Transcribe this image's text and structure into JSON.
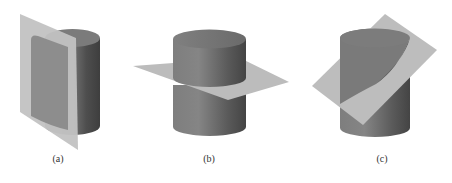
{
  "figure": {
    "panels": [
      {
        "id": "a",
        "label": "(a)",
        "plane_orientation": "vertical",
        "caption_x": 58
      },
      {
        "id": "b",
        "label": "(b)",
        "plane_orientation": "horizontal",
        "caption_x": 209
      },
      {
        "id": "c",
        "label": "(c)",
        "plane_orientation": "oblique",
        "caption_x": 382
      }
    ],
    "colors": {
      "cylinder_light": "#8a8a8a",
      "cylinder_dark": "#4a4a4a",
      "cylinder_top": "#777777",
      "plane": "#bdbdbd",
      "background": "#ffffff"
    }
  }
}
